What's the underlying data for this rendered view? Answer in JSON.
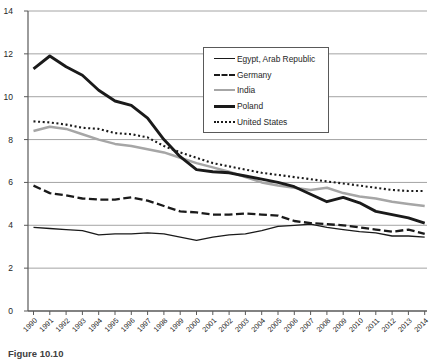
{
  "chart_data": {
    "type": "line",
    "title": "",
    "xlabel": "",
    "ylabel": "",
    "ylim": [
      0,
      14
    ],
    "y_ticks": [
      0,
      2,
      4,
      6,
      8,
      10,
      12,
      14
    ],
    "grid": "horizontal",
    "legend_position": "inside-top-center",
    "x": [
      1990,
      1991,
      1992,
      1993,
      1994,
      1995,
      1996,
      1997,
      1998,
      1999,
      2000,
      2001,
      2002,
      2003,
      2004,
      2005,
      2006,
      2007,
      2008,
      2009,
      2010,
      2011,
      2012,
      2013,
      2014
    ],
    "series": [
      {
        "name": "Egypt, Arab Republic",
        "style": "solid-thin",
        "color": "#1a1a1a",
        "values": [
          3.9,
          3.85,
          3.8,
          3.75,
          3.55,
          3.6,
          3.6,
          3.65,
          3.6,
          3.45,
          3.3,
          3.45,
          3.55,
          3.6,
          3.75,
          3.95,
          4.0,
          4.05,
          3.9,
          3.8,
          3.7,
          3.65,
          3.5,
          3.5,
          3.45
        ]
      },
      {
        "name": "Germany",
        "style": "dashed",
        "color": "#1a1a1a",
        "values": [
          5.85,
          5.5,
          5.4,
          5.25,
          5.2,
          5.2,
          5.3,
          5.15,
          4.9,
          4.65,
          4.6,
          4.5,
          4.5,
          4.55,
          4.5,
          4.45,
          4.2,
          4.1,
          4.05,
          4.0,
          3.9,
          3.8,
          3.7,
          3.8,
          3.6
        ]
      },
      {
        "name": "India",
        "style": "solid-gray",
        "color": "#a6a6a6",
        "values": [
          8.4,
          8.6,
          8.5,
          8.25,
          8.0,
          7.8,
          7.7,
          7.55,
          7.4,
          7.15,
          6.9,
          6.7,
          6.5,
          6.25,
          6.0,
          5.85,
          5.75,
          5.65,
          5.75,
          5.5,
          5.35,
          5.25,
          5.1,
          5.0,
          4.9
        ]
      },
      {
        "name": "Poland",
        "style": "solid-thick",
        "color": "#1a1a1a",
        "values": [
          11.3,
          11.9,
          11.4,
          11.0,
          10.3,
          9.8,
          9.6,
          9.0,
          8.0,
          7.2,
          6.6,
          6.5,
          6.45,
          6.3,
          6.15,
          6.0,
          5.8,
          5.45,
          5.1,
          5.3,
          5.05,
          4.65,
          4.5,
          4.35,
          4.1
        ]
      },
      {
        "name": "United States",
        "style": "dotted",
        "color": "#1a1a1a",
        "values": [
          8.85,
          8.8,
          8.7,
          8.55,
          8.5,
          8.3,
          8.25,
          8.1,
          7.7,
          7.4,
          7.15,
          6.9,
          6.75,
          6.6,
          6.45,
          6.35,
          6.25,
          6.15,
          6.05,
          5.95,
          5.85,
          5.75,
          5.65,
          5.6,
          5.6
        ]
      }
    ]
  },
  "caption": {
    "text": "Figure 10.10"
  }
}
